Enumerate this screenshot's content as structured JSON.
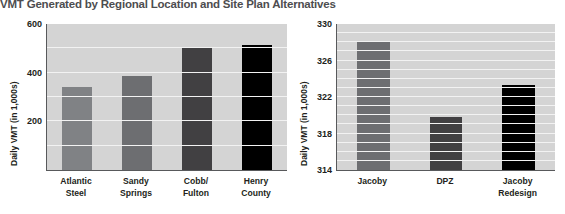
{
  "title": "VMT Generated by Regional Location and Site Plan Alternatives",
  "chart_data": [
    {
      "type": "bar",
      "title": "VMT Generated by Regional Location and Site Plan Alternatives",
      "panel": "regional-location",
      "categories": [
        "Atlantic Steel",
        "Sandy Springs",
        "Cobb/Fulton",
        "Henry County"
      ],
      "category_lines": [
        [
          "Atlantic",
          "Steel"
        ],
        [
          "Sandy",
          "Springs"
        ],
        [
          "Cobb/",
          "Fulton"
        ],
        [
          "Henry",
          "County"
        ]
      ],
      "values": [
        340,
        385,
        505,
        515
      ],
      "colors": [
        "#808285",
        "#6d6e71",
        "#414042",
        "#000000"
      ],
      "xlabel": "",
      "ylabel": "Daily VMT (in 1,000s)",
      "ylim": [
        0,
        600
      ],
      "yticks": [
        200,
        400,
        600
      ],
      "ytick_labels": [
        "200",
        "400",
        "600"
      ],
      "gridlines": [
        100,
        200,
        300,
        400,
        500
      ],
      "grid": true,
      "legend": "none"
    },
    {
      "type": "bar",
      "panel": "site-plan-alternatives",
      "categories": [
        "Jacoby",
        "DPZ",
        "Jacoby Redesign"
      ],
      "category_lines": [
        [
          "Jacoby"
        ],
        [
          "DPZ"
        ],
        [
          "Jacoby",
          "Redesign"
        ]
      ],
      "values": [
        328,
        319.8,
        323.3
      ],
      "colors": [
        "#6d6e71",
        "#414042",
        "#000000"
      ],
      "xlabel": "",
      "ylabel": "Daily VMT (in 1,000s)",
      "ylim": [
        314,
        330
      ],
      "yticks": [
        314,
        318,
        322,
        326,
        330
      ],
      "ytick_labels": [
        "314",
        "318",
        "322",
        "326",
        "330"
      ],
      "gridlines": [
        315,
        316,
        317,
        318,
        319,
        320,
        321,
        322,
        323,
        324,
        325,
        326,
        327,
        328,
        329
      ],
      "grid": true,
      "legend": "none"
    }
  ],
  "colors": {
    "plot_background": "#d4d4d4",
    "gridline": "#f2f2f2",
    "axis": "#58595b",
    "title_text": "#4d4d4f",
    "label_text": "#231f20",
    "page_background": "#ffffff"
  }
}
